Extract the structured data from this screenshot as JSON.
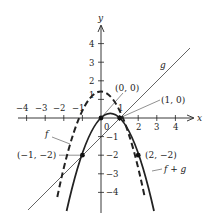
{
  "diagram": {
    "type": "function-graph",
    "axes": {
      "x_label": "x",
      "y_label": "y",
      "x_ticks": [
        {
          "value": -4,
          "label": "−4"
        },
        {
          "value": -3,
          "label": "−3"
        },
        {
          "value": -2,
          "label": "−2"
        },
        {
          "value": -1,
          "label": "−1"
        },
        {
          "value": 1,
          "label": "1"
        },
        {
          "value": 2,
          "label": "2"
        },
        {
          "value": 3,
          "label": "3"
        },
        {
          "value": 4,
          "label": "4"
        }
      ],
      "y_ticks": [
        {
          "value": 4,
          "label": "4"
        },
        {
          "value": 3,
          "label": "3"
        },
        {
          "value": 2,
          "label": "2"
        },
        {
          "value": 1,
          "label": "1"
        },
        {
          "value": -1,
          "label": "−1"
        },
        {
          "value": -2,
          "label": "−2"
        },
        {
          "value": -3,
          "label": "−3"
        },
        {
          "value": -4,
          "label": "−4"
        }
      ],
      "origin_label": "0"
    },
    "curves": [
      {
        "name": "f",
        "label": "f",
        "style": "dashed",
        "expression": "1 - x^2"
      },
      {
        "name": "g",
        "label": "g",
        "style": "thin",
        "expression": "x - 1"
      },
      {
        "name": "f+g",
        "label": "f + g",
        "style": "solid-thick",
        "expression": "x - x^2"
      }
    ],
    "points": [
      {
        "label": "(0, 0)",
        "x": 0,
        "y": 0
      },
      {
        "label": "(1, 0)",
        "x": 1,
        "y": 0
      },
      {
        "label": "(−1, −2)",
        "x": -1,
        "y": -2
      },
      {
        "label": "(2, −2)",
        "x": 2,
        "y": -2
      }
    ],
    "stroke_color": "#222222"
  }
}
